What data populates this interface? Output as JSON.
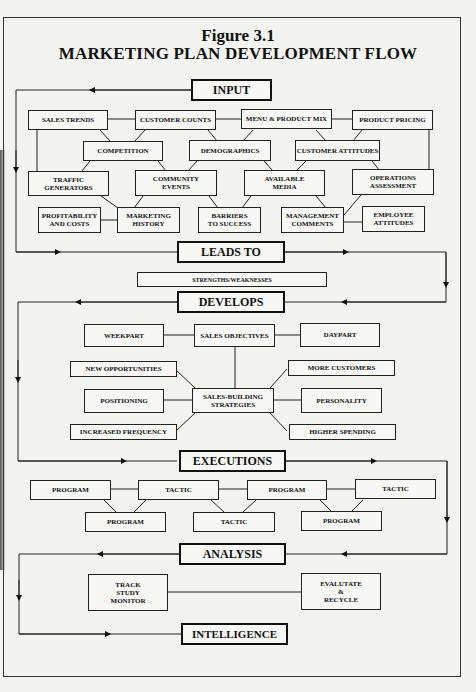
{
  "figure": {
    "number": "Figure 3.1",
    "title": "MARKETING PLAN DEVELOPMENT FLOW"
  },
  "stages": {
    "input": "INPUT",
    "leads_to": "LEADS TO",
    "develops": "DEVELOPS",
    "executions": "EXECUTIONS",
    "analysis": "ANALYSIS",
    "intelligence": "INTELLIGENCE"
  },
  "input_factors": {
    "sales_trends": "SALES TRENDS",
    "customer_counts": "CUSTOMER COUNTS",
    "menu_product_mix": "MENU & PRODUCT MIX",
    "product_pricing": "PRODUCT PRICING",
    "competition": "COMPETITION",
    "demographics": "DEMOGRAPHICS",
    "customer_attitudes": "CUSTOMER ATTITUDES",
    "traffic_generators": "TRAFFIC\nGENERATORS",
    "community_events": "COMMUNITY\nEVENTS",
    "available_media": "AVAILABLE\nMEDIA",
    "operations_assessment": "OPERATIONS\nASSESSMENT",
    "profitability_costs": "PROFITABILITY\nAND COSTS",
    "marketing_history": "MARKETING\nHISTORY",
    "barriers_to_success": "BARRIERS\nTO SUCCESS",
    "management_comments": "MANAGEMENT\nCOMMENTS",
    "employee_attitudes": "EMPLOYEE\nATTITUDES"
  },
  "leads_to_items": {
    "strengths_weaknesses": "STRENGTHS/WEAKNESSES"
  },
  "develops_items": {
    "weekpart": "WEEKPART",
    "sales_objectives": "SALES OBJECTIVES",
    "daypart": "DAYPART",
    "new_opportunities": "NEW OPPORTUNITIES",
    "more_customers": "MORE CUSTOMERS",
    "positioning": "POSITIONING",
    "sales_building_strategies": "SALES-BUILDING\nSTRATEGIES",
    "personality": "PERSONALITY",
    "increased_frequency": "INCREASED FREQUENCY",
    "higher_spending": "HIGHER SPENDING"
  },
  "executions_items": {
    "top": [
      "PROGRAM",
      "TACTIC",
      "PROGRAM",
      "TACTIC"
    ],
    "bottom": [
      "PROGRAM",
      "TACTIC",
      "PROGRAM"
    ]
  },
  "analysis_items": {
    "track_study_monitor": "TRACK\nSTUDY\nMONITOR",
    "evaluate_recycle": "EVALUTATE\n&\nRECYCLE"
  }
}
